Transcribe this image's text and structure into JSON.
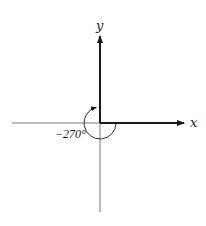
{
  "figure": {
    "type": "angle-in-standard-position",
    "axes": {
      "x_label": "x",
      "y_label": "y"
    },
    "angle": {
      "label": "−270°",
      "value_degrees": -270,
      "direction": "clockwise",
      "initial_side": "positive x-axis",
      "terminal_side": "positive y-axis"
    },
    "colors": {
      "axis": "#555555",
      "ray": "#1a1a1a",
      "background": "#ffffff"
    }
  }
}
